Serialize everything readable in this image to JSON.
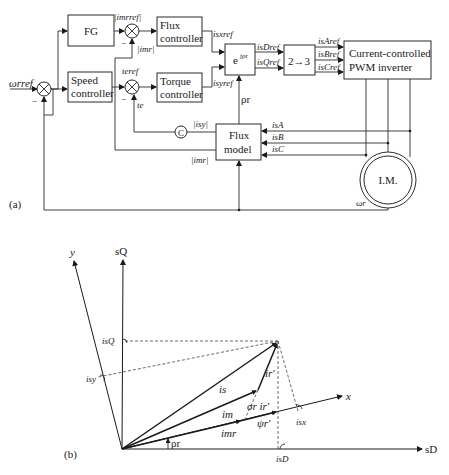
{
  "figure_a": {
    "label": "(a)",
    "blocks": {
      "fg": "FG",
      "flux_controller": [
        "Flux",
        "controller"
      ],
      "speed_controller": [
        "Speed",
        "controller"
      ],
      "torque_controller": [
        "Torque",
        "controller"
      ],
      "rotation": "e",
      "rotation_sup": "jρr",
      "transform": "2→3",
      "inverter": [
        "Current-controlled",
        "PWM inverter"
      ],
      "flux_model": [
        "Flux",
        "model"
      ],
      "c_block": "C",
      "motor": "I.M."
    },
    "signals": {
      "omega_ref": "ωrref",
      "imr_ref": "|imrref|",
      "imr_fb": "|imr|",
      "te_ref": "teref",
      "te": "te",
      "isx_ref": "isxref",
      "isy_ref": "isyref",
      "isD_ref": "isDref",
      "isQ_ref": "isQref",
      "isA_ref": "isAref",
      "isB_ref": "isBref",
      "isC_ref": "isCref",
      "rho_r": "ρr",
      "isA": "isA",
      "isB": "isB",
      "isC": "isC",
      "isy_mag": "|isy|",
      "imr_mag": "|imr|",
      "omega_r": "ωr",
      "minus": "−"
    }
  },
  "figure_b": {
    "label": "(b)",
    "axes": {
      "sD": "sD",
      "sQ": "sQ",
      "x": "x",
      "y": "y"
    },
    "vectors": {
      "is": "is",
      "ir": "ir'",
      "im": "im",
      "imr": "imr",
      "sigma_ir": "σr ir'",
      "psi_r": "ψr'"
    },
    "projections": {
      "isD": "isD",
      "isQ": "isQ",
      "isx": "isx",
      "isy": "isy"
    },
    "angle": "ρr"
  }
}
